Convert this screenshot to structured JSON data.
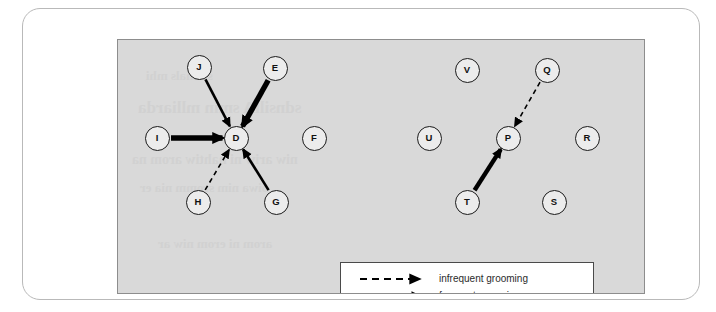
{
  "figure": {
    "kind": "grooming-network-diagram",
    "panel_background": "#d9d9d9",
    "frame_border": "#b9b9b9",
    "node_fill": "#ececec",
    "node_stroke": "#1a1a1a",
    "edge_color": "#000000"
  },
  "nodes": [
    {
      "id": "J",
      "label": "J",
      "x": 81,
      "y": 27
    },
    {
      "id": "E",
      "label": "E",
      "x": 157,
      "y": 28
    },
    {
      "id": "I",
      "label": "I",
      "x": 39,
      "y": 98
    },
    {
      "id": "D",
      "label": "D",
      "x": 118,
      "y": 98
    },
    {
      "id": "F",
      "label": "F",
      "x": 196,
      "y": 98
    },
    {
      "id": "H",
      "label": "H",
      "x": 80,
      "y": 162
    },
    {
      "id": "G",
      "label": "G",
      "x": 158,
      "y": 162
    },
    {
      "id": "V",
      "label": "V",
      "x": 349,
      "y": 30
    },
    {
      "id": "Q",
      "label": "Q",
      "x": 429,
      "y": 30
    },
    {
      "id": "U",
      "label": "U",
      "x": 311,
      "y": 98
    },
    {
      "id": "P",
      "label": "P",
      "x": 390,
      "y": 98
    },
    {
      "id": "R",
      "label": "R",
      "x": 469,
      "y": 98
    },
    {
      "id": "T",
      "label": "T",
      "x": 349,
      "y": 162
    },
    {
      "id": "S",
      "label": "S",
      "x": 436,
      "y": 162
    }
  ],
  "edges": [
    {
      "from": "J",
      "to": "D",
      "weight": "frequent",
      "style": "solid",
      "width": 2.6
    },
    {
      "from": "E",
      "to": "D",
      "weight": "very_frequent",
      "style": "solid",
      "width": 5.4
    },
    {
      "from": "I",
      "to": "D",
      "weight": "very_frequent",
      "style": "solid",
      "width": 5.4
    },
    {
      "from": "H",
      "to": "D",
      "weight": "infrequent",
      "style": "dashed",
      "width": 1.6
    },
    {
      "from": "G",
      "to": "D",
      "weight": "frequent",
      "style": "solid",
      "width": 2.6
    },
    {
      "from": "Q",
      "to": "P",
      "weight": "infrequent",
      "style": "dashed",
      "width": 1.6
    },
    {
      "from": "T",
      "to": "P",
      "weight": "very_frequent",
      "style": "solid",
      "width": 4.4
    }
  ],
  "legend": {
    "rows": [
      {
        "key": "infrequent",
        "label": "infrequent grooming",
        "style": "dashed",
        "width": 2.0
      },
      {
        "key": "frequent",
        "label": "frequent grooming",
        "style": "solid",
        "width": 2.6
      },
      {
        "key": "very_frequent",
        "label": "very frequent grooming",
        "style": "solid",
        "width": 6.0
      }
    ]
  },
  "bleed_text": [
    {
      "text": "snimals mhi",
      "x": 28,
      "y": 28,
      "size": 13
    },
    {
      "text": "sdnsillA smin  mlliarda",
      "x": 20,
      "y": 58,
      "size": 17
    },
    {
      "text": "niw ariw ni nahtiw arom na",
      "x": 14,
      "y": 112,
      "size": 14
    },
    {
      "text": "oiwa nim sromm nia er",
      "x": 22,
      "y": 140,
      "size": 13
    },
    {
      "text": "arom ni erom niw ar",
      "x": 40,
      "y": 196,
      "size": 13
    }
  ]
}
